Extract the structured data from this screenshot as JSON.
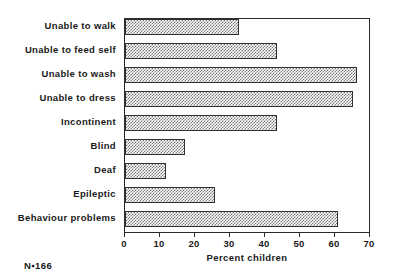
{
  "chart_data": {
    "type": "bar",
    "orientation": "horizontal",
    "title": "",
    "xlabel": "Percent children",
    "ylabel": "",
    "xlim": [
      0,
      70
    ],
    "xticks": [
      0,
      10,
      20,
      30,
      40,
      50,
      60,
      70
    ],
    "grid": false,
    "legend": null,
    "categories": [
      "Unable to walk",
      "Unable to feed self",
      "Unable to wash",
      "Unable to dress",
      "Incontinent",
      "Blind",
      "Deaf",
      "Epileptic",
      "Behaviour problems"
    ],
    "values": [
      32.5,
      43.4,
      66.3,
      65.1,
      43.4,
      17.1,
      11.7,
      25.7,
      60.9
    ],
    "annotations": [
      "N=166"
    ]
  },
  "footer": {
    "sample_size": "N▪166"
  },
  "colors": {
    "axis": "#2b2b2b",
    "bar_outline": "#2f2f2f",
    "bar_fill_pattern": "#7a7a7a",
    "background": "#ffffff",
    "text": "#1a1a1a"
  }
}
